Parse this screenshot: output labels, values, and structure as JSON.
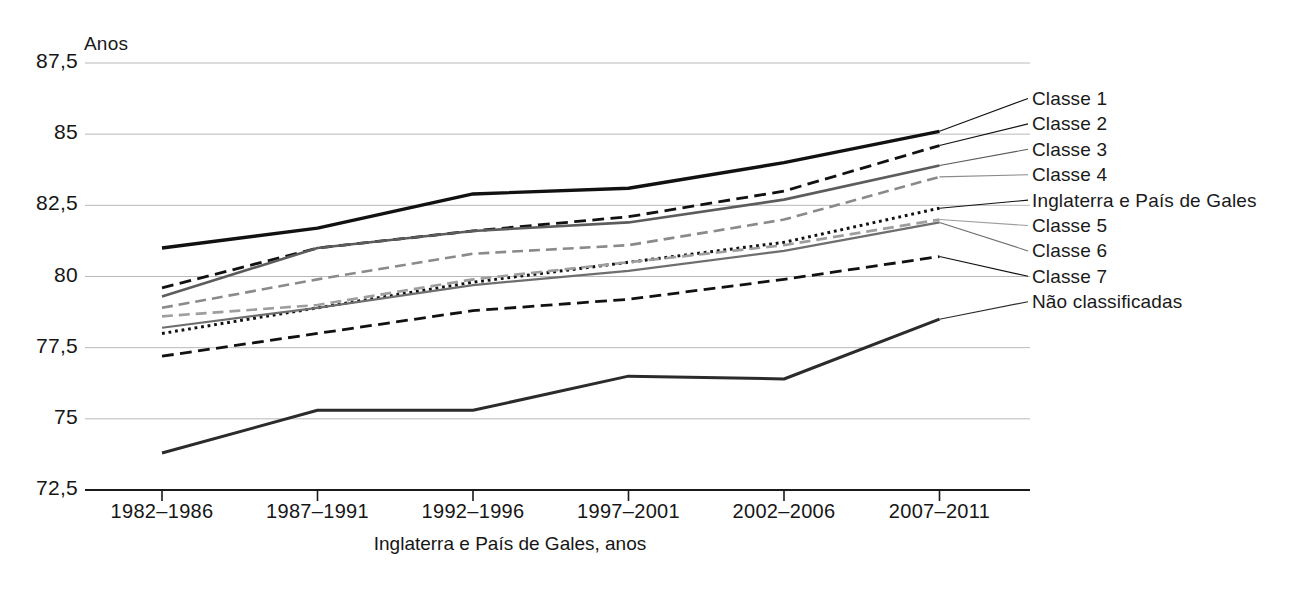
{
  "chart_data": {
    "type": "line",
    "title": "",
    "subtitle": "",
    "xlabel": "Inglaterra e País de Gales, anos",
    "ylabel": "Anos",
    "categories": [
      "1982–1986",
      "1987–1991",
      "1992–1996",
      "1997–2001",
      "2002–2006",
      "2007–2011"
    ],
    "ylim": [
      72.5,
      87.5
    ],
    "yticks": [
      "72,5",
      "75",
      "77,5",
      "80",
      "82,5",
      "85",
      "87,5"
    ],
    "ytick_values": [
      72.5,
      75,
      77.5,
      80,
      82.5,
      85,
      87.5
    ],
    "grid": true,
    "legend_position": "right",
    "series": [
      {
        "name": "Classe 1",
        "values": [
          81.0,
          81.7,
          82.9,
          83.1,
          84.0,
          85.1
        ],
        "style": "solid",
        "color": "#111111",
        "width": 3.4
      },
      {
        "name": "Classe 2",
        "values": [
          79.6,
          81.0,
          81.6,
          82.1,
          83.0,
          84.6
        ],
        "style": "dashed",
        "color": "#111111",
        "width": 2.8
      },
      {
        "name": "Classe 3",
        "values": [
          79.3,
          81.0,
          81.6,
          81.9,
          82.7,
          83.9
        ],
        "style": "solid",
        "color": "#5c5c5c",
        "width": 2.6
      },
      {
        "name": "Classe 4",
        "values": [
          78.9,
          79.9,
          80.8,
          81.1,
          82.0,
          83.5
        ],
        "style": "dashed",
        "color": "#8a8a8a",
        "width": 2.6
      },
      {
        "name": "Inglaterra e País de Gales",
        "values": [
          78.0,
          78.9,
          79.8,
          80.5,
          81.2,
          82.4
        ],
        "style": "dotted",
        "color": "#111111",
        "width": 3.0
      },
      {
        "name": "Classe 5",
        "values": [
          78.6,
          79.0,
          79.9,
          80.5,
          81.1,
          82.0
        ],
        "style": "dashed",
        "color": "#9e9e9e",
        "width": 2.6
      },
      {
        "name": "Classe 6",
        "values": [
          78.2,
          78.9,
          79.7,
          80.2,
          80.9,
          81.9
        ],
        "style": "solid",
        "color": "#6e6e6e",
        "width": 2.2
      },
      {
        "name": "Classe 7",
        "values": [
          77.2,
          78.0,
          78.8,
          79.2,
          79.9,
          80.7
        ],
        "style": "dashed",
        "color": "#111111",
        "width": 2.8
      },
      {
        "name": "Não classificadas",
        "values": [
          73.8,
          75.3,
          75.3,
          76.5,
          76.4,
          78.5
        ],
        "style": "solid",
        "color": "#2b2b2b",
        "width": 3.0
      }
    ]
  },
  "legend": {
    "items": [
      {
        "label": "Classe 1"
      },
      {
        "label": "Classe 2"
      },
      {
        "label": "Classe 3"
      },
      {
        "label": "Classe 4"
      },
      {
        "label": "Inglaterra e País de Gales"
      },
      {
        "label": "Classe 5"
      },
      {
        "label": "Classe 6"
      },
      {
        "label": "Classe 7"
      },
      {
        "label": "Não classificadas"
      }
    ]
  }
}
